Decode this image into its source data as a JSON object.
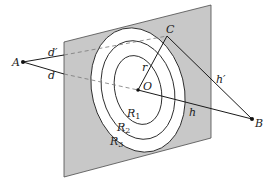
{
  "diagram": {
    "title": "",
    "colors": {
      "plane_fill": "#c8c8c8",
      "plane_stroke": "#4a4a4a",
      "ellipse_fill": "#ffffff",
      "line": "#1a1a1a",
      "dashed": "#777777",
      "text": "#222222"
    },
    "points": {
      "A": "A",
      "B": "B",
      "C": "C",
      "O": "O"
    },
    "segment_labels": {
      "d_prime": "d′",
      "d": "d",
      "h_prime": "h′",
      "h": "h",
      "r": "r"
    },
    "zones": [
      {
        "base": "R",
        "sub": "1"
      },
      {
        "base": "R",
        "sub": "2"
      },
      {
        "base": "R",
        "sub": "3"
      }
    ]
  }
}
